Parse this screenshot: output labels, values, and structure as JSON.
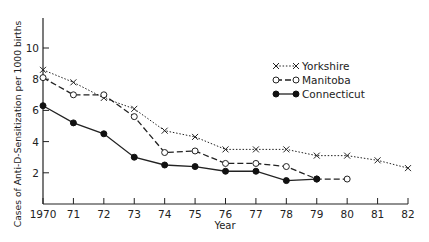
{
  "chart_data": {
    "type": "line",
    "title": "",
    "xlabel": "Year",
    "ylabel": "Cases of Anti-D-Sensitization per 1000 births",
    "x": [
      1970,
      1971,
      1972,
      1973,
      1974,
      1975,
      1976,
      1977,
      1978,
      1979,
      1980,
      1981,
      1982
    ],
    "x_tick_labels": [
      "1970",
      "71",
      "72",
      "73",
      "74",
      "75",
      "76",
      "77",
      "78",
      "79",
      "80",
      "81",
      "82"
    ],
    "y_ticks": [
      2,
      4,
      6,
      8,
      10
    ],
    "ylim": [
      0,
      11.5
    ],
    "xlim": [
      1970,
      1982
    ],
    "grid": false,
    "legend_position": "upper right",
    "series": [
      {
        "name": "Yorkshire",
        "marker": "x",
        "line": "dotted",
        "x": [
          1970,
          1971,
          1972,
          1973,
          1974,
          1975,
          1976,
          1977,
          1978,
          1979,
          1980,
          1981,
          1982
        ],
        "values": [
          8.6,
          7.8,
          6.8,
          6.1,
          4.7,
          4.3,
          3.5,
          3.5,
          3.5,
          3.1,
          3.1,
          2.8,
          2.3
        ]
      },
      {
        "name": "Manitoba",
        "marker": "open-circle",
        "line": "dashed",
        "x": [
          1970,
          1971,
          1972,
          1973,
          1974,
          1975,
          1976,
          1977,
          1978,
          1979,
          1980
        ],
        "values": [
          8.1,
          7.0,
          7.0,
          5.6,
          3.3,
          3.4,
          2.6,
          2.6,
          2.4,
          1.6,
          1.6
        ]
      },
      {
        "name": "Connecticut",
        "marker": "filled-circle",
        "line": "solid",
        "x": [
          1970,
          1971,
          1972,
          1973,
          1974,
          1975,
          1976,
          1977,
          1978,
          1979
        ],
        "values": [
          6.3,
          5.2,
          4.5,
          3.0,
          2.5,
          2.4,
          2.1,
          2.1,
          1.5,
          1.6
        ]
      }
    ]
  },
  "legend": {
    "items": [
      "Yorkshire",
      "Manitoba",
      "Connecticut"
    ]
  },
  "axes": {
    "xlabel": "Year",
    "ylabel": "Cases of Anti-D-Sensitization per 1000 births"
  }
}
